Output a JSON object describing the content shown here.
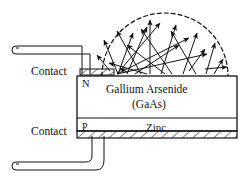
{
  "figure": {
    "labels": {
      "contact_top": "Contact",
      "contact_bottom": "Contact",
      "n_layer": "N",
      "p_layer": "P",
      "material_line1": "Gallium Arsenide",
      "material_line2": "(GaAs)",
      "zinc_layer": "Zinc"
    },
    "colors": {
      "stroke": "#111111",
      "background": "#ffffff",
      "arrow_fill": "#111111"
    }
  },
  "diagram_data": {
    "type": "schematic-cross-section",
    "emission_dome": {
      "style": "dashed-semicircle",
      "center_x": 165,
      "center_y": 76,
      "radius": 63,
      "dash": "4 3"
    },
    "body_block": {
      "x": 77,
      "y": 76,
      "width": 160,
      "height": 59
    },
    "n_region": {
      "x": 77,
      "y": 76,
      "width": 160,
      "height": 42
    },
    "p_region": {
      "x": 77,
      "y": 118,
      "width": 160,
      "height": 13
    },
    "hatched_contact_band": {
      "x": 77,
      "y": 131,
      "width": 160,
      "height": 7
    },
    "top_contact_pad": {
      "x": 80,
      "y": 69,
      "width": 34,
      "height": 6
    },
    "light_rays": [
      {
        "x1": 118,
        "y1": 74,
        "x2": 104,
        "y2": 40
      },
      {
        "x1": 118,
        "y1": 74,
        "x2": 132,
        "y2": 33
      },
      {
        "x1": 118,
        "y1": 74,
        "x2": 160,
        "y2": 22
      },
      {
        "x1": 118,
        "y1": 74,
        "x2": 188,
        "y2": 37
      },
      {
        "x1": 118,
        "y1": 74,
        "x2": 206,
        "y2": 53
      },
      {
        "x1": 126,
        "y1": 74,
        "x2": 146,
        "y2": 26
      },
      {
        "x1": 140,
        "y1": 74,
        "x2": 116,
        "y2": 30
      },
      {
        "x1": 150,
        "y1": 74,
        "x2": 150,
        "y2": 19
      },
      {
        "x1": 160,
        "y1": 74,
        "x2": 176,
        "y2": 24
      },
      {
        "x1": 172,
        "y1": 74,
        "x2": 140,
        "y2": 28
      },
      {
        "x1": 182,
        "y1": 74,
        "x2": 196,
        "y2": 32
      },
      {
        "x1": 196,
        "y1": 74,
        "x2": 170,
        "y2": 30
      },
      {
        "x1": 206,
        "y1": 74,
        "x2": 214,
        "y2": 42
      },
      {
        "x1": 214,
        "y1": 74,
        "x2": 222,
        "y2": 58
      },
      {
        "x1": 108,
        "y1": 70,
        "x2": 96,
        "y2": 54
      },
      {
        "x1": 204,
        "y1": 68,
        "x2": 226,
        "y2": 66
      },
      {
        "x1": 188,
        "y1": 70,
        "x2": 204,
        "y2": 48
      },
      {
        "x1": 164,
        "y1": 74,
        "x2": 126,
        "y2": 44
      },
      {
        "x1": 134,
        "y1": 74,
        "x2": 178,
        "y2": 44
      },
      {
        "x1": 146,
        "y1": 74,
        "x2": 108,
        "y2": 62
      }
    ],
    "leads": [
      {
        "name": "top-lead",
        "path": "M 14,50 L 86,50 L 86,70"
      },
      {
        "name": "bottom-lead",
        "path": "M 14,166 L 86,166 L 86,138"
      }
    ]
  }
}
